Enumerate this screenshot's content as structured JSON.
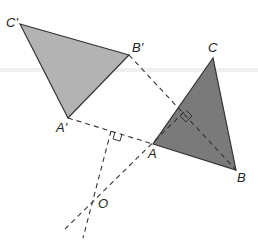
{
  "figure": {
    "colors": {
      "image_triangle_fill": "#b3b3b3",
      "original_triangle_fill": "#7a7a7a",
      "stroke": "#333333",
      "dashed": "#333333"
    },
    "points": {
      "C_prime": {
        "label": "C'",
        "x": 20,
        "y": 24
      },
      "B_prime": {
        "label": "B'",
        "x": 129,
        "y": 55
      },
      "A_prime": {
        "label": "A'",
        "x": 68,
        "y": 118
      },
      "C": {
        "label": "C",
        "x": 213,
        "y": 58
      },
      "A": {
        "label": "A",
        "x": 153,
        "y": 144
      },
      "B": {
        "label": "B",
        "x": 236,
        "y": 170
      },
      "O": {
        "label": "O",
        "x": 97,
        "y": 199
      }
    },
    "labels": {
      "C_prime": "C'",
      "B_prime": "B'",
      "A_prime": "A'",
      "C": "C",
      "A": "A",
      "B": "B",
      "O": "O"
    }
  }
}
